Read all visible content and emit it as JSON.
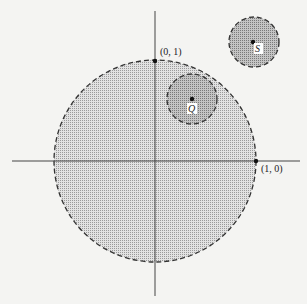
{
  "diagram": {
    "axes": {
      "x_axis": true,
      "y_axis": true
    },
    "points": {
      "p01": {
        "label": "(0, 1)"
      },
      "p10": {
        "label": "(1, 0)"
      },
      "q": {
        "label": "Q"
      },
      "s": {
        "label": "S"
      }
    },
    "regions": [
      {
        "name": "unit-disk",
        "boundary": "dashed",
        "fill": "dotted light gray"
      },
      {
        "name": "disk-around-Q",
        "boundary": "dashed",
        "fill": "darker gray"
      },
      {
        "name": "disk-around-S",
        "boundary": "dashed",
        "fill": "darker gray"
      }
    ],
    "colors": {
      "light_fill": "#d4d4d4",
      "dark_fill": "#b3b3b3",
      "line": "#333333"
    }
  }
}
